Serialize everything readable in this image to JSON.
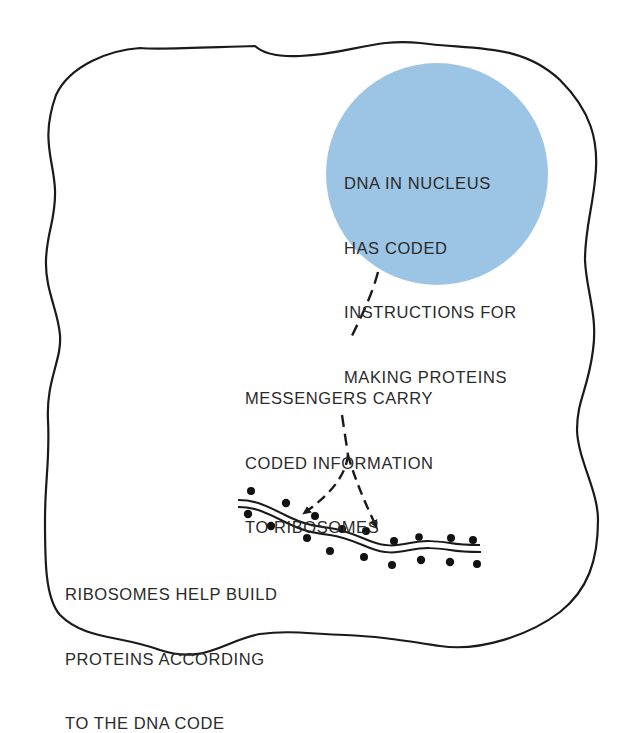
{
  "diagram": {
    "type": "cell-protein-synthesis",
    "colors": {
      "nucleus_fill": "#9cc4e4",
      "outline": "#1a1a1a",
      "text": "#2a2a2a",
      "background": "#ffffff"
    },
    "nucleus": {
      "lines": [
        "DNA IN NUCLEUS",
        "HAS CODED",
        "INSTRUCTIONS FOR",
        "MAKING PROTEINS"
      ]
    },
    "messenger": {
      "lines": [
        "MESSENGERS CARRY",
        "CODED INFORMATION",
        "TO RIBOSOMES"
      ]
    },
    "ribosomes": {
      "lines": [
        "RIBOSOMES HELP BUILD",
        "PROTEINS ACCORDING",
        "TO THE DNA CODE"
      ]
    }
  }
}
